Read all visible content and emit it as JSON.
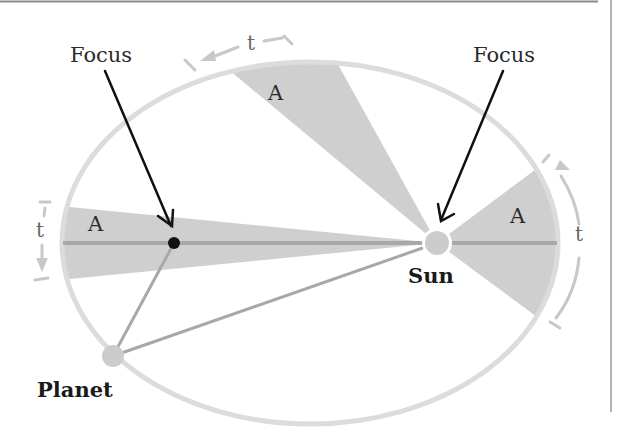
{
  "diagram": {
    "labels": {
      "focus_left": "Focus",
      "focus_right": "Focus",
      "sun": "Sun",
      "planet": "Planet",
      "area_top": "A",
      "area_left": "A",
      "area_right": "A",
      "time_top": "t",
      "time_left": "t",
      "time_right": "t"
    },
    "colors": {
      "orbit": "#dcdcdc",
      "sector": "#cfcfcf",
      "axis": "#a8a8a8",
      "sun": "#cccccc",
      "planet": "#cccccc",
      "arrow": "#111111",
      "time_arrow": "#c8c8c8",
      "frame": "#888888"
    },
    "geometry": {
      "ellipse_center": [
        310,
        243
      ],
      "ellipse_rx": 248,
      "ellipse_ry": 181,
      "sun": [
        437,
        243
      ],
      "empty_focus": [
        174,
        243
      ],
      "planet": [
        113,
        356
      ]
    }
  }
}
